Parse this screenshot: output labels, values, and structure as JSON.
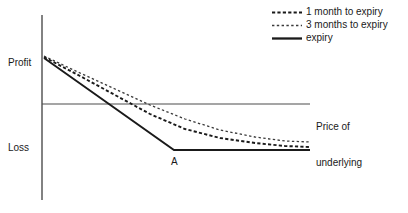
{
  "figure": {
    "background": "#ffffff",
    "ink": "#1a1a1a",
    "axis_color": "#4d4d4d"
  },
  "axes": {
    "y_axis_label_top": "Profit",
    "y_axis_label_bottom": "Loss",
    "x_axis_label_line1": "Price of",
    "x_axis_label_line2": "underlying"
  },
  "annotations": {
    "kink_point": "A"
  },
  "legend": {
    "entries": [
      {
        "label": "1 month to expiry",
        "style": "dashed-bold",
        "color": "#1a1a1a"
      },
      {
        "label": "3 months to expiry",
        "style": "dashed-fine",
        "color": "#3a3a3a"
      },
      {
        "label": "expiry",
        "style": "solid",
        "color": "#1a1a1a"
      }
    ]
  },
  "chart_data": {
    "type": "line",
    "title": "",
    "xlabel": "Price of underlying",
    "ylabel": "Profit / Loss",
    "grid": false,
    "legend_position": "top-right",
    "x_axis": {
      "zero_line_y": 0,
      "range_px": [
        42,
        310
      ],
      "tick_labels": []
    },
    "y_axis": {
      "range_px": [
        15,
        200
      ],
      "tick_labels": [
        "Profit",
        "Loss"
      ]
    },
    "annotations": [
      {
        "text": "A",
        "x_px": 174,
        "y_px": 150,
        "note": "kink where expiry payoff becomes flat"
      }
    ],
    "series": [
      {
        "name": "expiry",
        "style": "solid",
        "color": "#1a1a1a",
        "points_px": [
          [
            44,
            58
          ],
          [
            174,
            150
          ],
          [
            310,
            150
          ]
        ]
      },
      {
        "name": "1 month to expiry",
        "style": "dashed-bold",
        "color": "#1a1a1a",
        "points_px": [
          [
            44,
            57
          ],
          [
            80,
            76
          ],
          [
            115,
            95
          ],
          [
            150,
            114
          ],
          [
            185,
            129
          ],
          [
            220,
            138
          ],
          [
            255,
            143
          ],
          [
            285,
            146
          ],
          [
            310,
            147
          ]
        ]
      },
      {
        "name": "3 months to expiry",
        "style": "dashed-fine",
        "color": "#3a3a3a",
        "points_px": [
          [
            44,
            56
          ],
          [
            80,
            73
          ],
          [
            115,
            89
          ],
          [
            150,
            105
          ],
          [
            185,
            119
          ],
          [
            220,
            130
          ],
          [
            255,
            137
          ],
          [
            285,
            141
          ],
          [
            310,
            142
          ]
        ]
      }
    ]
  }
}
